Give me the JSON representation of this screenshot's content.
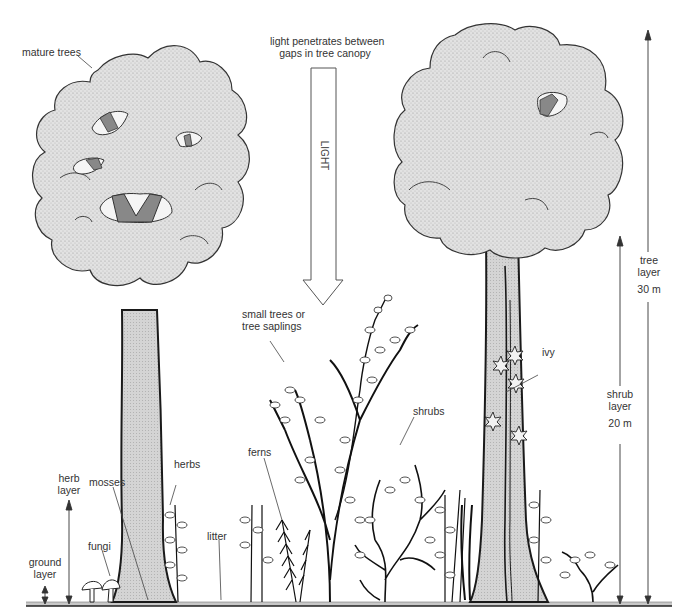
{
  "diagram": {
    "colors": {
      "canopy_fill": "#d9d9d9",
      "trunk_fill": "#cfcfcf",
      "gap_fill": "#8a8a8a",
      "ink": "#1a1a1a",
      "label_text": "#333333"
    },
    "labels": {
      "mature_trees": "mature trees",
      "light_caption_line1": "light penetrates between",
      "light_caption_line2": "gaps in tree canopy",
      "light_arrow": "LIGHT",
      "small_trees_line1": "small trees or",
      "small_trees_line2": "tree saplings",
      "ivy": "ivy",
      "shrubs": "shrubs",
      "ferns": "ferns",
      "herbs": "herbs",
      "mosses": "mosses",
      "fungi": "fungi",
      "litter": "litter"
    },
    "layers": [
      {
        "name_line1": "tree",
        "name_line2": "layer",
        "height": "30 m"
      },
      {
        "name_line1": "shrub",
        "name_line2": "layer",
        "height": "20 m"
      },
      {
        "name_line1": "herb",
        "name_line2": "layer",
        "height": ""
      },
      {
        "name_line1": "ground",
        "name_line2": "layer",
        "height": ""
      }
    ]
  }
}
